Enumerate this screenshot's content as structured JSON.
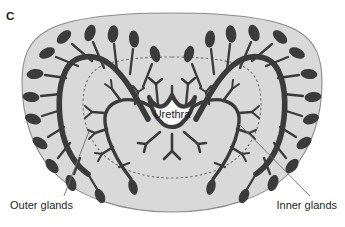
{
  "figure": {
    "panel_letter": "C",
    "colors": {
      "background": "#ffffff",
      "stroma_fill": "#d9d9d9",
      "stroma_outline": "#8a8a8a",
      "gland_dark": "#3b3b3b",
      "inner_zone_dashed": "#6f6f6f",
      "urethra_fill": "#fbfbfb",
      "urethra_outline": "#3b3b3b",
      "leader_line": "#6d6d6d",
      "text": "#1d1d1d"
    }
  },
  "labels": {
    "urethra": "Urethra",
    "outer_glands": "Outer glands",
    "inner_glands": "Inner glands"
  },
  "annotations": [
    {
      "name": "outer-glands-annotation",
      "text": "Outer glands",
      "text_x": 10,
      "text_y": 207,
      "leader": {
        "x1": 64,
        "y1": 196,
        "x2": 89,
        "y2": 131
      }
    },
    {
      "name": "inner-glands-annotation",
      "text": "Inner glands",
      "text_x": 266,
      "text_y": 207,
      "leader": {
        "x1": 310,
        "y1": 196,
        "x2": 239,
        "y2": 124
      }
    }
  ],
  "structures": {
    "outer_glands_count": 24,
    "inner_glands_count": 2,
    "periurethral_cluster": true,
    "has_dashed_inner_zone_boundary": true,
    "urethra_shape": "crescent"
  }
}
